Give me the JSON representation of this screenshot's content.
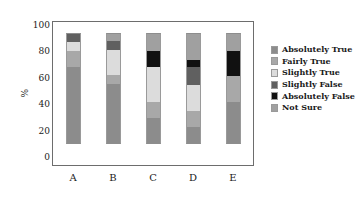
{
  "chart_data": {
    "type": "bar",
    "subtype": "stacked-bar-percentage",
    "title": "",
    "xlabel": "",
    "ylabel": "%",
    "categories": [
      "A",
      "B",
      "C",
      "D",
      "E"
    ],
    "ylim": [
      0,
      100
    ],
    "yticks": [
      0,
      20,
      40,
      60,
      80,
      100
    ],
    "ytick_labels": [
      "0",
      "20",
      "40",
      "60",
      "80",
      "100"
    ],
    "grid": false,
    "legend_position": "right",
    "series": [
      {
        "name": "Absolutely True",
        "color": "#8c8c8c",
        "values": [
          69,
          54,
          23,
          15,
          38
        ]
      },
      {
        "name": "Fairly True",
        "color": "#a8a8a8",
        "values": [
          15,
          8,
          15,
          15,
          23
        ]
      },
      {
        "name": "Slightly True",
        "color": "#dcdcdc",
        "values": [
          8,
          23,
          31,
          23,
          0
        ]
      },
      {
        "name": "Slightly False",
        "color": "#606060",
        "values": [
          7,
          8,
          0,
          16,
          0
        ]
      },
      {
        "name": "Absolutely False",
        "color": "#111111",
        "values": [
          0,
          0,
          15,
          7,
          23
        ]
      },
      {
        "name": "Not Sure",
        "color": "#a0a0a0",
        "values": [
          1,
          7,
          16,
          24,
          16
        ]
      }
    ]
  },
  "legend": {
    "items": [
      {
        "label": "Absolutely True",
        "color": "#8c8c8c"
      },
      {
        "label": "Fairly True",
        "color": "#a8a8a8"
      },
      {
        "label": "Slightly True",
        "color": "#dcdcdc"
      },
      {
        "label": "Slightly False",
        "color": "#606060"
      },
      {
        "label": "Absolutely False",
        "color": "#111111"
      },
      {
        "label": "Not Sure",
        "color": "#a0a0a0"
      }
    ]
  },
  "axes": {
    "y_axis_label": "%",
    "y_tick_labels": [
      "100",
      "80",
      "60",
      "40",
      "20",
      "0"
    ],
    "x_tick_labels": [
      "A",
      "B",
      "C",
      "D",
      "E"
    ]
  }
}
